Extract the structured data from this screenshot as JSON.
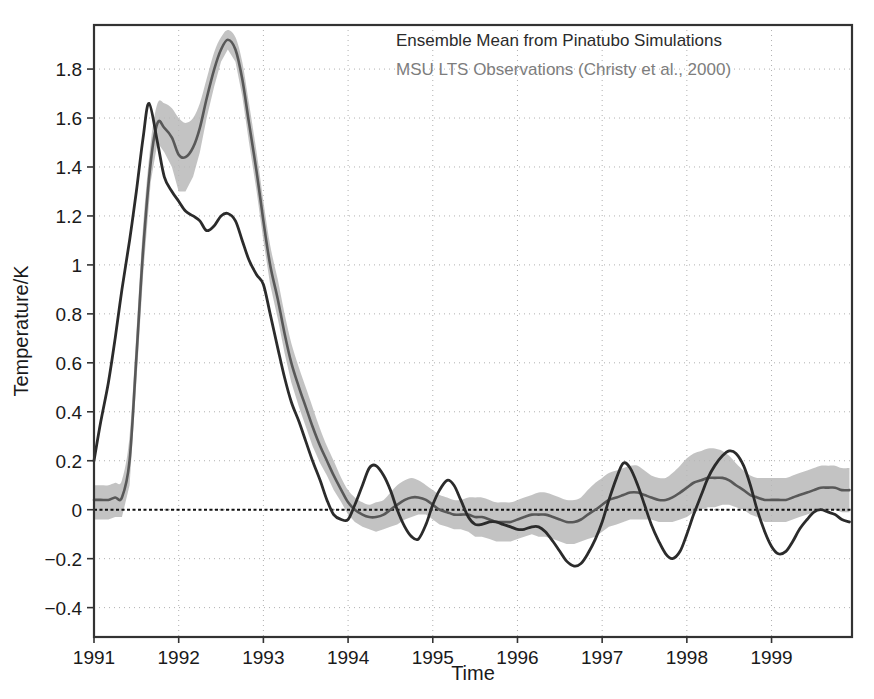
{
  "chart_data": {
    "type": "line",
    "title": "",
    "xlabel": "Time",
    "ylabel": "Temperature/K",
    "xlim": [
      1991.0,
      1999.95
    ],
    "ylim": [
      -0.52,
      1.98
    ],
    "grid": true,
    "grid_style": "dotted",
    "legend_position": "top-right-inside",
    "annotations": [
      "Ensemble Mean from Pinatubo Simulations",
      "MSU LTS Observations (Christy et al., 2000)"
    ],
    "xticks": [
      1991,
      1992,
      1993,
      1994,
      1995,
      1996,
      1997,
      1998,
      1999
    ],
    "xtick_labels": [
      "1991",
      "1992",
      "1993",
      "1994",
      "1995",
      "1996",
      "1997",
      "1998",
      "1999"
    ],
    "yticks": [
      -0.4,
      -0.2,
      0,
      0.2,
      0.4,
      0.6,
      0.8,
      1,
      1.2,
      1.4,
      1.6,
      1.8
    ],
    "ytick_labels": [
      "−0.4",
      "−0.2",
      "0",
      "0.2",
      "0.4",
      "0.6",
      "0.8",
      "1",
      "1.2",
      "1.4",
      "1.6",
      "1.8"
    ],
    "zero_line": 0,
    "colors": {
      "ensemble_mean": "#585858",
      "observations": "#2b2b2b",
      "uncertainty_band": "#b6b6b6",
      "grid": "#b0b0b0",
      "axis": "#333333"
    },
    "series": [
      {
        "name": "Ensemble Mean from Pinatubo Simulations",
        "color": "#585858",
        "has_uncertainty_band": true,
        "x": [
          1991.0,
          1991.08,
          1991.17,
          1991.25,
          1991.33,
          1991.42,
          1991.5,
          1991.58,
          1991.67,
          1991.75,
          1991.83,
          1991.92,
          1992.0,
          1992.08,
          1992.17,
          1992.25,
          1992.33,
          1992.42,
          1992.5,
          1992.58,
          1992.67,
          1992.75,
          1992.83,
          1992.92,
          1993.0,
          1993.08,
          1993.17,
          1993.25,
          1993.33,
          1993.42,
          1993.5,
          1993.58,
          1993.67,
          1993.75,
          1993.83,
          1993.92,
          1994.0,
          1994.08,
          1994.17,
          1994.25,
          1994.33,
          1994.42,
          1994.5,
          1994.58,
          1994.67,
          1994.75,
          1994.83,
          1994.92,
          1995.0,
          1995.08,
          1995.17,
          1995.25,
          1995.33,
          1995.42,
          1995.5,
          1995.58,
          1995.67,
          1995.75,
          1995.83,
          1995.92,
          1996.0,
          1996.08,
          1996.17,
          1996.25,
          1996.33,
          1996.42,
          1996.5,
          1996.58,
          1996.67,
          1996.75,
          1996.83,
          1996.92,
          1997.0,
          1997.08,
          1997.17,
          1997.25,
          1997.33,
          1997.42,
          1997.5,
          1997.58,
          1997.67,
          1997.75,
          1997.83,
          1997.92,
          1998.0,
          1998.08,
          1998.17,
          1998.25,
          1998.33,
          1998.42,
          1998.5,
          1998.58,
          1998.67,
          1998.75,
          1998.83,
          1998.92,
          1999.0,
          1999.08,
          1999.17,
          1999.25,
          1999.33,
          1999.42,
          1999.5,
          1999.58,
          1999.67,
          1999.75,
          1999.83,
          1999.92
        ],
        "y": [
          0.04,
          0.04,
          0.04,
          0.05,
          0.05,
          0.2,
          0.62,
          1.06,
          1.42,
          1.58,
          1.56,
          1.52,
          1.45,
          1.44,
          1.48,
          1.56,
          1.68,
          1.8,
          1.88,
          1.92,
          1.88,
          1.76,
          1.58,
          1.38,
          1.18,
          1.0,
          0.86,
          0.72,
          0.6,
          0.5,
          0.42,
          0.34,
          0.26,
          0.2,
          0.14,
          0.08,
          0.03,
          0.0,
          -0.02,
          -0.03,
          -0.03,
          -0.02,
          0.0,
          0.02,
          0.04,
          0.05,
          0.05,
          0.04,
          0.02,
          0.0,
          -0.01,
          -0.02,
          -0.02,
          -0.02,
          -0.03,
          -0.03,
          -0.04,
          -0.05,
          -0.05,
          -0.05,
          -0.04,
          -0.03,
          -0.02,
          -0.02,
          -0.02,
          -0.03,
          -0.04,
          -0.05,
          -0.05,
          -0.04,
          -0.02,
          0.0,
          0.02,
          0.04,
          0.05,
          0.06,
          0.07,
          0.07,
          0.06,
          0.05,
          0.04,
          0.04,
          0.05,
          0.07,
          0.09,
          0.11,
          0.12,
          0.13,
          0.13,
          0.13,
          0.12,
          0.1,
          0.08,
          0.06,
          0.05,
          0.04,
          0.04,
          0.04,
          0.04,
          0.05,
          0.06,
          0.07,
          0.08,
          0.09,
          0.09,
          0.09,
          0.08,
          0.08
        ],
        "y_upper": [
          0.1,
          0.1,
          0.1,
          0.11,
          0.12,
          0.3,
          0.72,
          1.16,
          1.5,
          1.66,
          1.66,
          1.64,
          1.6,
          1.58,
          1.6,
          1.66,
          1.76,
          1.87,
          1.93,
          1.96,
          1.93,
          1.83,
          1.66,
          1.46,
          1.26,
          1.08,
          0.94,
          0.8,
          0.68,
          0.58,
          0.5,
          0.42,
          0.33,
          0.26,
          0.2,
          0.13,
          0.08,
          0.05,
          0.03,
          0.02,
          0.03,
          0.04,
          0.07,
          0.1,
          0.12,
          0.13,
          0.12,
          0.1,
          0.08,
          0.06,
          0.05,
          0.04,
          0.04,
          0.05,
          0.05,
          0.05,
          0.04,
          0.03,
          0.03,
          0.03,
          0.04,
          0.05,
          0.06,
          0.07,
          0.07,
          0.06,
          0.05,
          0.04,
          0.04,
          0.05,
          0.08,
          0.11,
          0.13,
          0.15,
          0.16,
          0.17,
          0.18,
          0.18,
          0.16,
          0.14,
          0.13,
          0.13,
          0.15,
          0.18,
          0.21,
          0.23,
          0.24,
          0.25,
          0.25,
          0.24,
          0.22,
          0.19,
          0.16,
          0.14,
          0.13,
          0.13,
          0.13,
          0.13,
          0.13,
          0.14,
          0.15,
          0.16,
          0.17,
          0.18,
          0.18,
          0.18,
          0.17,
          0.17
        ],
        "y_lower": [
          -0.04,
          -0.04,
          -0.04,
          -0.03,
          -0.03,
          0.1,
          0.52,
          0.96,
          1.34,
          1.5,
          1.46,
          1.4,
          1.3,
          1.3,
          1.36,
          1.46,
          1.6,
          1.73,
          1.83,
          1.88,
          1.83,
          1.69,
          1.5,
          1.3,
          1.1,
          0.92,
          0.78,
          0.64,
          0.52,
          0.42,
          0.34,
          0.26,
          0.19,
          0.14,
          0.08,
          0.03,
          -0.02,
          -0.05,
          -0.07,
          -0.08,
          -0.09,
          -0.08,
          -0.07,
          -0.06,
          -0.04,
          -0.03,
          -0.02,
          -0.02,
          -0.04,
          -0.06,
          -0.07,
          -0.08,
          -0.08,
          -0.09,
          -0.11,
          -0.11,
          -0.12,
          -0.13,
          -0.13,
          -0.13,
          -0.12,
          -0.11,
          -0.1,
          -0.11,
          -0.11,
          -0.12,
          -0.13,
          -0.14,
          -0.14,
          -0.13,
          -0.12,
          -0.11,
          -0.09,
          -0.07,
          -0.06,
          -0.05,
          -0.04,
          -0.04,
          -0.04,
          -0.04,
          -0.05,
          -0.05,
          -0.05,
          -0.04,
          -0.03,
          -0.01,
          0.0,
          0.01,
          0.01,
          0.02,
          0.02,
          0.01,
          0.0,
          -0.02,
          -0.03,
          -0.05,
          -0.05,
          -0.05,
          -0.05,
          -0.04,
          -0.03,
          -0.02,
          -0.01,
          0.0,
          0.0,
          0.0,
          -0.01,
          -0.01
        ]
      },
      {
        "name": "MSU LTS Observations (Christy et al., 2000)",
        "color": "#2b2b2b",
        "has_uncertainty_band": false,
        "x": [
          1991.0,
          1991.08,
          1991.17,
          1991.25,
          1991.33,
          1991.42,
          1991.5,
          1991.58,
          1991.65,
          1991.75,
          1991.83,
          1991.92,
          1992.0,
          1992.08,
          1992.17,
          1992.25,
          1992.33,
          1992.42,
          1992.5,
          1992.58,
          1992.67,
          1992.75,
          1992.83,
          1992.92,
          1993.0,
          1993.08,
          1993.17,
          1993.25,
          1993.33,
          1993.42,
          1993.5,
          1993.58,
          1993.67,
          1993.75,
          1993.83,
          1993.92,
          1994.0,
          1994.08,
          1994.17,
          1994.25,
          1994.33,
          1994.42,
          1994.5,
          1994.58,
          1994.67,
          1994.75,
          1994.83,
          1994.92,
          1995.0,
          1995.08,
          1995.17,
          1995.25,
          1995.33,
          1995.42,
          1995.5,
          1995.58,
          1995.67,
          1995.75,
          1995.83,
          1995.92,
          1996.0,
          1996.08,
          1996.17,
          1996.25,
          1996.33,
          1996.42,
          1996.5,
          1996.58,
          1996.67,
          1996.75,
          1996.83,
          1996.92,
          1997.0,
          1997.08,
          1997.17,
          1997.25,
          1997.33,
          1997.42,
          1997.5,
          1997.58,
          1997.67,
          1997.75,
          1997.83,
          1997.92,
          1998.0,
          1998.08,
          1998.17,
          1998.25,
          1998.33,
          1998.42,
          1998.5,
          1998.58,
          1998.67,
          1998.75,
          1998.83,
          1998.92,
          1999.0,
          1999.08,
          1999.17,
          1999.25,
          1999.33,
          1999.42,
          1999.5,
          1999.58,
          1999.67,
          1999.75,
          1999.83,
          1999.92
        ],
        "y": [
          0.2,
          0.36,
          0.52,
          0.7,
          0.9,
          1.1,
          1.3,
          1.52,
          1.66,
          1.5,
          1.36,
          1.3,
          1.26,
          1.22,
          1.2,
          1.18,
          1.14,
          1.16,
          1.2,
          1.21,
          1.18,
          1.1,
          1.02,
          0.96,
          0.92,
          0.8,
          0.66,
          0.54,
          0.44,
          0.36,
          0.28,
          0.2,
          0.12,
          0.04,
          -0.02,
          -0.04,
          -0.04,
          0.02,
          0.1,
          0.17,
          0.18,
          0.14,
          0.08,
          0.0,
          -0.07,
          -0.11,
          -0.12,
          -0.06,
          0.02,
          0.08,
          0.12,
          0.1,
          0.04,
          -0.03,
          -0.06,
          -0.06,
          -0.05,
          -0.05,
          -0.06,
          -0.07,
          -0.08,
          -0.08,
          -0.07,
          -0.07,
          -0.09,
          -0.13,
          -0.17,
          -0.21,
          -0.23,
          -0.22,
          -0.18,
          -0.12,
          -0.05,
          0.04,
          0.13,
          0.19,
          0.17,
          0.1,
          0.02,
          -0.06,
          -0.13,
          -0.18,
          -0.2,
          -0.17,
          -0.1,
          -0.02,
          0.06,
          0.13,
          0.18,
          0.22,
          0.24,
          0.23,
          0.18,
          0.1,
          0.0,
          -0.09,
          -0.15,
          -0.18,
          -0.17,
          -0.13,
          -0.08,
          -0.04,
          -0.01,
          0.0,
          -0.01,
          -0.02,
          -0.04,
          -0.05
        ]
      }
    ]
  },
  "axes": {
    "y_title": "Temperature/K",
    "x_title": "Time"
  }
}
